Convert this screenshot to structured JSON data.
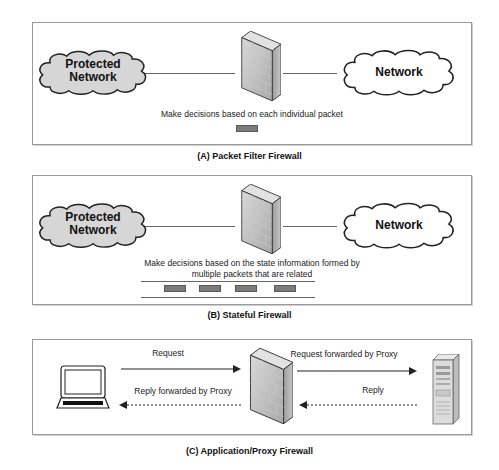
{
  "panels": [
    {
      "id": "A",
      "caption": "(A) Packet Filter Firewall",
      "left_cloud": {
        "line1": "Protected",
        "line2": "Network",
        "fill": "#d6d6d6"
      },
      "right_cloud": {
        "label": "Network",
        "fill": "#ffffff"
      },
      "description": "Make decisions based on each individual packet",
      "packets": 1
    },
    {
      "id": "B",
      "caption": "(B) Stateful Firewall",
      "left_cloud": {
        "line1": "Protected",
        "line2": "Network",
        "fill": "#d6d6d6"
      },
      "right_cloud": {
        "label": "Network",
        "fill": "#ffffff"
      },
      "description_line1": "Make decisions based on the state information formed by",
      "description_line2": "multiple packets that are related",
      "packets": 4
    },
    {
      "id": "C",
      "caption": "(C) Application/Proxy Firewall",
      "client_icon": "laptop-icon",
      "server_icon": "server-tower-icon",
      "arrows": {
        "request": "Request",
        "request_forwarded": "Request forwarded by Proxy",
        "reply": "Reply",
        "reply_forwarded": "Reply forwarded by Proxy"
      }
    }
  ],
  "colors": {
    "panel_border": "#9a9a9a",
    "packet": "#7b7b7b",
    "firewall_front": "#b8b8b8",
    "protected_cloud": "#d6d6d6"
  }
}
